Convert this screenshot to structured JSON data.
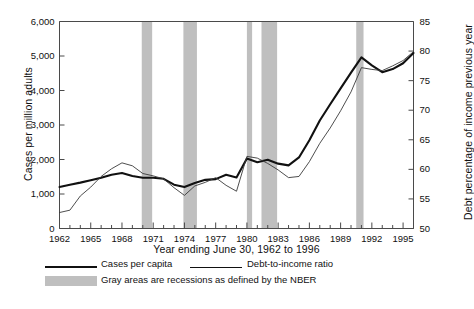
{
  "chart_data": {
    "type": "line",
    "title": "",
    "xlabel": "Year ending June 30, 1962 to 1996",
    "ylabel": "Cases per million adults",
    "ylabel_right": "Debt percentage of income previous year",
    "x": [
      1962,
      1963,
      1964,
      1965,
      1966,
      1967,
      1968,
      1969,
      1970,
      1971,
      1972,
      1973,
      1974,
      1975,
      1976,
      1977,
      1978,
      1979,
      1980,
      1981,
      1982,
      1983,
      1984,
      1985,
      1986,
      1987,
      1988,
      1989,
      1990,
      1991,
      1992,
      1993,
      1994,
      1995,
      1996
    ],
    "xlim": [
      1962,
      1996
    ],
    "xticks": [
      1962,
      1965,
      1968,
      1971,
      1974,
      1977,
      1980,
      1983,
      1986,
      1989,
      1992,
      1995
    ],
    "xtick_labels": [
      "1962",
      "1965",
      "1968",
      "1971",
      "1974",
      "1977",
      "1980",
      "1983",
      "1986",
      "1989",
      "1992",
      "1995"
    ],
    "xtick_minor_step": 1,
    "ylim": [
      0,
      6000
    ],
    "yticks": [
      0,
      1000,
      2000,
      3000,
      4000,
      5000,
      6000
    ],
    "ytick_labels": [
      "0",
      "1,000",
      "2,000",
      "3,000",
      "4,000",
      "5,000",
      "6,000"
    ],
    "ylim_right": [
      50,
      85
    ],
    "yticks_right": [
      50,
      55,
      60,
      65,
      70,
      75,
      80,
      85
    ],
    "ytick_labels_right": [
      "50",
      "55",
      "60",
      "65",
      "70",
      "75",
      "80",
      "85"
    ],
    "grid": false,
    "legend_position": "below-left",
    "series": [
      {
        "name": "Cases per capita",
        "axis": "left",
        "color": "#111111",
        "width": 2.1,
        "values": [
          1200,
          1270,
          1330,
          1400,
          1470,
          1560,
          1610,
          1520,
          1470,
          1470,
          1440,
          1270,
          1200,
          1320,
          1410,
          1430,
          1560,
          1480,
          2030,
          1920,
          1990,
          1880,
          1830,
          2060,
          2560,
          3130,
          3600,
          4060,
          4520,
          4960,
          4730,
          4530,
          4620,
          4790,
          5090
        ]
      },
      {
        "name": "Debt-to-income ratio",
        "axis": "right",
        "color": "#3a3a3a",
        "width": 0.9,
        "values": [
          52.7,
          53.1,
          55.5,
          57.0,
          58.8,
          60.1,
          61.1,
          60.6,
          59.3,
          58.9,
          58.4,
          56.9,
          55.6,
          57.2,
          57.8,
          58.6,
          57.3,
          56.3,
          62.2,
          61.9,
          61.0,
          59.9,
          58.6,
          58.8,
          61.3,
          64.4,
          67.0,
          69.9,
          73.1,
          77.2,
          76.9,
          76.7,
          77.5,
          78.4,
          79.9
        ]
      }
    ],
    "recessions": [
      {
        "start": 1969.9,
        "end": 1970.9
      },
      {
        "start": 1973.9,
        "end": 1975.2
      },
      {
        "start": 1980.0,
        "end": 1980.5
      },
      {
        "start": 1981.4,
        "end": 1982.9
      },
      {
        "start": 1990.5,
        "end": 1991.2
      }
    ],
    "recession_color": "#bfbfbf"
  },
  "legend": {
    "items": [
      {
        "label": "Cases per capita",
        "kind": "line",
        "weight": "thick"
      },
      {
        "label": "Debt-to-income ratio",
        "kind": "line",
        "weight": "thin"
      },
      {
        "label": "Gray areas are recessions as defined by the NBER",
        "kind": "swatch"
      }
    ]
  }
}
